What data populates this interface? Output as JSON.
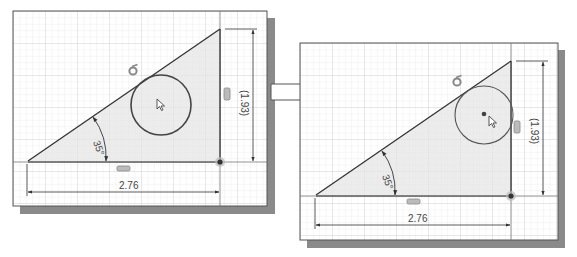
{
  "figure": {
    "arrow": {
      "direction": "right"
    }
  },
  "colors": {
    "grid_minor": "#e2e2e2",
    "grid_major": "#cfcfcf",
    "line": "#333333",
    "fill": "#ececec",
    "shadow": "#8a8a8a",
    "constraint_icon": "#8c8c8c"
  },
  "panels": [
    {
      "name": "before",
      "dimensions": {
        "horizontal": "2.76",
        "vertical": "(1.93)",
        "angle": "35°"
      },
      "constraints": [
        "tangent",
        "vertical",
        "horizontal",
        "fixed-point"
      ],
      "circle": {
        "center_marker": "cursor"
      }
    },
    {
      "name": "after",
      "dimensions": {
        "horizontal": "2.76",
        "vertical": "(1.93)",
        "angle": "35°"
      },
      "constraints": [
        "tangent",
        "vertical",
        "horizontal",
        "fixed-point"
      ],
      "circle": {
        "center_marker": "center-point",
        "cursor": "pointer"
      }
    }
  ]
}
